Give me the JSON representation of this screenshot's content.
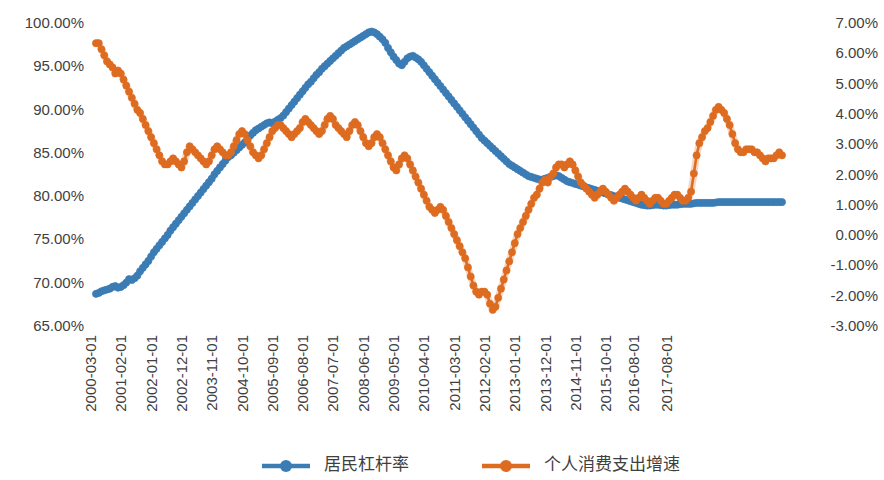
{
  "chart_data": {
    "type": "line",
    "title": "",
    "xlabel": "",
    "ylabel": "",
    "grid": false,
    "legend_position": "bottom",
    "x_tick_labels": [
      "2000-03-01",
      "2001-02-01",
      "2002-01-01",
      "2002-12-01",
      "2003-11-01",
      "2004-10-01",
      "2005-09-01",
      "2006-08-01",
      "2007-07-01",
      "2008-06-01",
      "2009-05-01",
      "2010-04-01",
      "2011-03-01",
      "2012-02-01",
      "2013-01-01",
      "2013-12-01",
      "2014-11-01",
      "2015-10-01",
      "2016-08-01",
      "2017-08-01"
    ],
    "x_tick_indices": [
      0,
      11,
      22,
      33,
      44,
      55,
      66,
      77,
      88,
      99,
      110,
      121,
      132,
      143,
      154,
      165,
      176,
      187,
      197,
      209
    ],
    "left_axis": {
      "tick_labels": [
        "100.00%",
        "95.00%",
        "90.00%",
        "85.00%",
        "80.00%",
        "75.00%",
        "70.00%",
        "65.00%"
      ],
      "tick_values": [
        100,
        95,
        90,
        85,
        80,
        75,
        70,
        65
      ],
      "ylim": [
        65,
        100
      ]
    },
    "right_axis": {
      "tick_labels": [
        "7.00%",
        "6.00%",
        "5.00%",
        "4.00%",
        "3.00%",
        "2.00%",
        "1.00%",
        "0.00%",
        "-1.00%",
        "-2.00%",
        "-3.00%"
      ],
      "tick_values": [
        7,
        6,
        5,
        4,
        3,
        2,
        1,
        0,
        -1,
        -2,
        -3
      ],
      "ylim": [
        -3,
        7
      ]
    },
    "series": [
      {
        "name": "居民杠杆率",
        "axis": "left",
        "color": "#3b7cb5",
        "marker": "circle",
        "values": [
          68.6,
          68.7,
          68.9,
          69.0,
          69.1,
          69.2,
          69.4,
          69.5,
          69.3,
          69.4,
          69.6,
          69.9,
          70.3,
          70.2,
          70.4,
          70.7,
          71.2,
          71.6,
          72.0,
          72.4,
          72.9,
          73.4,
          73.8,
          74.2,
          74.6,
          75.0,
          75.4,
          75.9,
          76.3,
          76.7,
          77.1,
          77.5,
          77.9,
          78.3,
          78.7,
          79.1,
          79.5,
          79.9,
          80.3,
          80.7,
          81.1,
          81.5,
          81.9,
          82.4,
          82.8,
          83.2,
          83.6,
          84.0,
          84.4,
          84.6,
          84.9,
          85.2,
          85.5,
          85.8,
          86.1,
          86.5,
          86.9,
          87.2,
          87.5,
          87.7,
          87.9,
          88.1,
          88.3,
          88.4,
          88.3,
          88.5,
          88.7,
          88.9,
          89.2,
          89.6,
          90.0,
          90.4,
          90.8,
          91.2,
          91.6,
          92.0,
          92.4,
          92.8,
          93.1,
          93.5,
          93.9,
          94.2,
          94.6,
          94.9,
          95.2,
          95.5,
          95.8,
          96.1,
          96.4,
          96.7,
          97.0,
          97.2,
          97.4,
          97.6,
          97.8,
          98.0,
          98.2,
          98.4,
          98.6,
          98.8,
          98.9,
          98.8,
          98.6,
          98.3,
          98.0,
          97.6,
          97.0,
          96.5,
          96.0,
          95.6,
          95.2,
          95.0,
          95.4,
          95.8,
          96.0,
          96.1,
          95.9,
          95.7,
          95.4,
          95.0,
          94.6,
          94.2,
          93.8,
          93.4,
          93.0,
          92.6,
          92.2,
          91.8,
          91.4,
          91.0,
          90.6,
          90.2,
          89.8,
          89.4,
          89.0,
          88.6,
          88.2,
          87.8,
          87.4,
          87.0,
          86.6,
          86.3,
          86.0,
          85.7,
          85.4,
          85.1,
          84.8,
          84.5,
          84.2,
          83.9,
          83.6,
          83.4,
          83.2,
          83.0,
          82.8,
          82.6,
          82.4,
          82.2,
          82.1,
          82.0,
          81.9,
          81.8,
          81.8,
          81.9,
          82.0,
          82.1,
          82.2,
          82.3,
          82.2,
          82.0,
          81.8,
          81.6,
          81.5,
          81.4,
          81.3,
          81.2,
          81.1,
          81.0,
          80.9,
          80.8,
          80.7,
          80.6,
          80.5,
          80.4,
          80.3,
          80.2,
          80.1,
          80.0,
          79.9,
          79.8,
          79.7,
          79.6,
          79.5,
          79.4,
          79.3,
          79.2,
          79.1,
          79.0,
          78.9,
          78.85,
          78.8,
          78.8,
          78.85,
          78.9,
          78.9,
          78.85,
          78.8,
          78.8,
          78.85,
          78.9,
          78.9,
          78.9,
          78.95,
          79.0,
          79.0,
          79.0,
          79.0,
          79.05,
          79.1,
          79.1,
          79.1,
          79.1,
          79.1,
          79.1,
          79.1,
          79.15,
          79.2,
          79.2,
          79.2,
          79.2,
          79.2,
          79.2,
          79.2,
          79.2,
          79.2,
          79.2,
          79.2,
          79.2,
          79.2,
          79.2,
          79.2,
          79.2,
          79.2,
          79.2,
          79.2,
          79.2,
          79.2,
          79.2,
          79.2,
          79.2
        ],
        "note": "Resident leverage ratio (left axis, %)"
      },
      {
        "name": "个人消费支出增速",
        "axis": "right",
        "color": "#dd6b20",
        "marker": "circle",
        "values": [
          6.3,
          6.3,
          6.1,
          5.9,
          5.7,
          5.6,
          5.5,
          5.3,
          5.4,
          5.3,
          5.1,
          4.9,
          4.7,
          4.5,
          4.3,
          4.1,
          4.0,
          3.8,
          3.6,
          3.4,
          3.2,
          3.0,
          2.8,
          2.6,
          2.4,
          2.3,
          2.3,
          2.4,
          2.5,
          2.4,
          2.3,
          2.2,
          2.4,
          2.7,
          2.9,
          2.8,
          2.7,
          2.6,
          2.5,
          2.4,
          2.3,
          2.4,
          2.6,
          2.8,
          2.9,
          2.8,
          2.7,
          2.6,
          2.6,
          2.7,
          2.9,
          3.1,
          3.3,
          3.4,
          3.3,
          3.1,
          2.9,
          2.7,
          2.6,
          2.5,
          2.6,
          2.8,
          3.0,
          3.2,
          3.4,
          3.5,
          3.6,
          3.6,
          3.5,
          3.4,
          3.3,
          3.2,
          3.3,
          3.4,
          3.5,
          3.7,
          3.8,
          3.7,
          3.6,
          3.5,
          3.4,
          3.3,
          3.4,
          3.6,
          3.8,
          3.9,
          3.8,
          3.6,
          3.5,
          3.4,
          3.3,
          3.2,
          3.4,
          3.6,
          3.7,
          3.6,
          3.4,
          3.2,
          3.0,
          2.9,
          3.0,
          3.2,
          3.3,
          3.2,
          3.0,
          2.8,
          2.6,
          2.4,
          2.2,
          2.1,
          2.3,
          2.5,
          2.6,
          2.5,
          2.3,
          2.1,
          1.9,
          1.7,
          1.5,
          1.3,
          1.1,
          0.9,
          0.8,
          0.7,
          0.8,
          0.9,
          0.8,
          0.6,
          0.4,
          0.2,
          0.0,
          -0.2,
          -0.4,
          -0.6,
          -0.8,
          -1.1,
          -1.4,
          -1.7,
          -1.9,
          -2.0,
          -1.9,
          -1.9,
          -2.0,
          -2.3,
          -2.5,
          -2.4,
          -2.1,
          -1.8,
          -1.5,
          -1.2,
          -0.9,
          -0.6,
          -0.3,
          0.0,
          0.2,
          0.4,
          0.6,
          0.8,
          1.0,
          1.2,
          1.3,
          1.5,
          1.7,
          1.8,
          1.7,
          1.9,
          2.0,
          2.2,
          2.3,
          2.3,
          2.2,
          2.3,
          2.4,
          2.3,
          2.1,
          1.9,
          1.7,
          1.6,
          1.5,
          1.4,
          1.3,
          1.2,
          1.3,
          1.4,
          1.5,
          1.4,
          1.3,
          1.2,
          1.1,
          1.2,
          1.3,
          1.4,
          1.5,
          1.4,
          1.3,
          1.2,
          1.1,
          1.2,
          1.3,
          1.2,
          1.1,
          1.0,
          1.1,
          1.2,
          1.2,
          1.1,
          1.0,
          1.0,
          1.1,
          1.2,
          1.3,
          1.3,
          1.2,
          1.1,
          1.1,
          1.2,
          1.4,
          2.0,
          2.6,
          3.0,
          3.2,
          3.4,
          3.5,
          3.7,
          3.9,
          4.1,
          4.2,
          4.1,
          4.0,
          3.8,
          3.6,
          3.3,
          3.0,
          2.8,
          2.7,
          2.7,
          2.8,
          2.8,
          2.8,
          2.7,
          2.7,
          2.6,
          2.5,
          2.4,
          2.5,
          2.5,
          2.5,
          2.6,
          2.7,
          2.6
        ],
        "note": "Personal consumption expenditure growth rate (right axis, %)"
      }
    ]
  },
  "legend": {
    "items": [
      {
        "label": "居民杠杆率",
        "color": "#3b7cb5"
      },
      {
        "label": "个人消费支出增速",
        "color": "#dd6b20"
      }
    ]
  }
}
